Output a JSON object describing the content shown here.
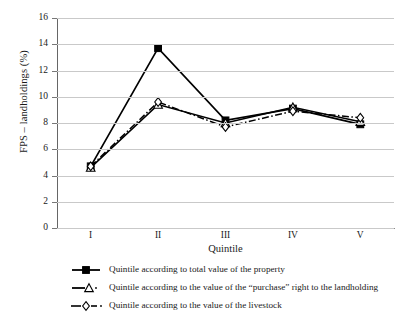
{
  "chart_data": {
    "type": "line",
    "title": "",
    "xlabel": "Quintile",
    "ylabel": "FPS – landholdings (%)",
    "categories": [
      "I",
      "II",
      "III",
      "IV",
      "V"
    ],
    "ylim": [
      0,
      16
    ],
    "ytick_step": 2,
    "yticks": [
      "16",
      "14",
      "12",
      "10",
      "8",
      "6",
      "4",
      "2",
      "0"
    ],
    "grid": "horizontal",
    "legend_position": "bottom",
    "series": [
      {
        "name": "Quintile according to total value of the property",
        "marker": "filled-square",
        "line_style": "solid",
        "color": "#000000",
        "values": [
          4.7,
          13.7,
          8.2,
          9.1,
          7.9
        ]
      },
      {
        "name": "Quintile according to the value of the “purchase” right to the landholding",
        "marker": "open-triangle",
        "line_style": "solid",
        "color": "#000000",
        "values": [
          4.6,
          9.4,
          8.0,
          9.2,
          8.1
        ]
      },
      {
        "name": "Quintile according to the value of the livestock",
        "marker": "open-diamond",
        "line_style": "dash-dot",
        "color": "#000000",
        "values": [
          4.7,
          9.6,
          7.7,
          8.9,
          8.4
        ]
      }
    ]
  },
  "axes": {
    "y_label": "FPS – landholdings (%)",
    "x_label": "Quintile"
  },
  "legend": {
    "items": [
      {
        "label": "Quintile according to total value of the property"
      },
      {
        "label": "Quintile according to the value of the “purchase” right to the landholding"
      },
      {
        "label": "Quintile according to the value of the livestock"
      }
    ]
  }
}
